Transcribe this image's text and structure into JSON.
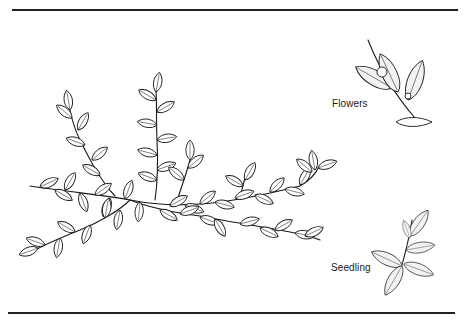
{
  "figure": {
    "labels": {
      "flowers": "Flowers",
      "seedling": "Seedling"
    },
    "colors": {
      "ink": "#1a1a1a",
      "background": "#ffffff"
    }
  }
}
